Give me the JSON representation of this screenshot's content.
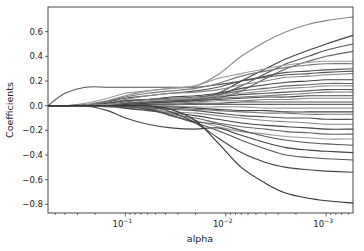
{
  "chart_data": {
    "type": "line",
    "title": "",
    "xlabel": "alpha",
    "ylabel": "Coefficients",
    "xscale": "log",
    "x_reversed": true,
    "xlim": [
      0.59,
      0.00054
    ],
    "ylim": [
      -0.87,
      0.8
    ],
    "grid": false,
    "legend": null,
    "x_ticks": [
      {
        "value": 0.1,
        "label": "10",
        "exp": "−1"
      },
      {
        "value": 0.01,
        "label": "10",
        "exp": "−2"
      },
      {
        "value": 0.001,
        "label": "10",
        "exp": "−3"
      }
    ],
    "y_ticks": [
      0.6,
      0.4,
      0.2,
      0.0,
      -0.2,
      -0.4,
      -0.6,
      -0.8
    ],
    "y_tick_labels": [
      "0.6",
      "0.4",
      "0.2",
      "0.0",
      "−0.2",
      "−0.4",
      "−0.6",
      "−0.8"
    ],
    "x": [
      0.59,
      0.4,
      0.25,
      0.15,
      0.1,
      0.06,
      0.035,
      0.02,
      0.012,
      0.007,
      0.004,
      0.0025,
      0.0015,
      0.001,
      0.00054
    ],
    "series": [
      {
        "name": "coef_1",
        "color": "#555555",
        "values": [
          0,
          0.1,
          0.15,
          0.15,
          0.15,
          0.15,
          0.15,
          0.15,
          0.17,
          0.2,
          0.23,
          0.25,
          0.26,
          0.27,
          0.28
        ]
      },
      {
        "name": "coef_2",
        "color": "#888888",
        "values": [
          0,
          0,
          0,
          0.04,
          0.08,
          0.12,
          0.14,
          0.16,
          0.25,
          0.4,
          0.52,
          0.6,
          0.66,
          0.69,
          0.72
        ]
      },
      {
        "name": "coef_3",
        "color": "#444444",
        "values": [
          0,
          0,
          0,
          0.02,
          0.04,
          0.05,
          0.05,
          0.06,
          0.1,
          0.2,
          0.3,
          0.38,
          0.45,
          0.5,
          0.57
        ]
      },
      {
        "name": "coef_4",
        "color": "#555555",
        "values": [
          0,
          0,
          0,
          0,
          0.02,
          0.03,
          0.04,
          0.05,
          0.08,
          0.16,
          0.26,
          0.34,
          0.4,
          0.45,
          0.5
        ]
      },
      {
        "name": "coef_5",
        "color": "#666666",
        "values": [
          0,
          0,
          0,
          0,
          0,
          0.02,
          0.03,
          0.04,
          0.06,
          0.12,
          0.22,
          0.3,
          0.36,
          0.4,
          0.44
        ]
      },
      {
        "name": "coef_6",
        "color": "#999999",
        "values": [
          0,
          0,
          0.02,
          0.06,
          0.1,
          0.12,
          0.14,
          0.16,
          0.22,
          0.26,
          0.3,
          0.33,
          0.35,
          0.36,
          0.36
        ]
      },
      {
        "name": "coef_7",
        "color": "#777777",
        "values": [
          0,
          0,
          0.01,
          0.04,
          0.07,
          0.1,
          0.12,
          0.14,
          0.18,
          0.24,
          0.28,
          0.31,
          0.33,
          0.34,
          0.34
        ]
      },
      {
        "name": "coef_8",
        "color": "#555555",
        "values": [
          0,
          0,
          0,
          0.03,
          0.06,
          0.08,
          0.1,
          0.12,
          0.15,
          0.2,
          0.24,
          0.27,
          0.28,
          0.29,
          0.3
        ]
      },
      {
        "name": "coef_9",
        "color": "#888888",
        "values": [
          0,
          0,
          0,
          0.02,
          0.05,
          0.08,
          0.1,
          0.11,
          0.13,
          0.17,
          0.2,
          0.23,
          0.24,
          0.25,
          0.26
        ]
      },
      {
        "name": "coef_10",
        "color": "#444444",
        "values": [
          0,
          0,
          0,
          0.02,
          0.04,
          0.05,
          0.07,
          0.08,
          0.1,
          0.14,
          0.17,
          0.19,
          0.2,
          0.21,
          0.21
        ]
      },
      {
        "name": "coef_11",
        "color": "#666666",
        "values": [
          0,
          0,
          0,
          0.01,
          0.03,
          0.05,
          0.06,
          0.07,
          0.09,
          0.12,
          0.14,
          0.16,
          0.17,
          0.18,
          0.18
        ]
      },
      {
        "name": "coef_12",
        "color": "#999999",
        "values": [
          0,
          0,
          0,
          0.01,
          0.02,
          0.04,
          0.05,
          0.06,
          0.08,
          0.1,
          0.12,
          0.14,
          0.15,
          0.16,
          0.16
        ]
      },
      {
        "name": "coef_13",
        "color": "#555555",
        "values": [
          0,
          0,
          0,
          0,
          0.02,
          0.03,
          0.04,
          0.05,
          0.07,
          0.09,
          0.1,
          0.11,
          0.12,
          0.13,
          0.13
        ]
      },
      {
        "name": "coef_14",
        "color": "#777777",
        "values": [
          0,
          0,
          0,
          0,
          0.01,
          0.02,
          0.03,
          0.04,
          0.06,
          0.07,
          0.08,
          0.09,
          0.1,
          0.11,
          0.11
        ]
      },
      {
        "name": "coef_15",
        "color": "#444444",
        "values": [
          0,
          0,
          0,
          0,
          0.01,
          0.02,
          0.03,
          0.04,
          0.05,
          0.06,
          0.07,
          0.07,
          0.08,
          0.08,
          0.08
        ]
      },
      {
        "name": "coef_16",
        "color": "#888888",
        "values": [
          0,
          0,
          0,
          0,
          0,
          0.01,
          0.02,
          0.03,
          0.04,
          0.04,
          0.05,
          0.05,
          0.06,
          0.06,
          0.06
        ]
      },
      {
        "name": "coef_17",
        "color": "#555555",
        "values": [
          0,
          0,
          0,
          0,
          0,
          0.01,
          0.01,
          0.02,
          0.02,
          0.03,
          0.03,
          0.03,
          0.03,
          0.03,
          0.03
        ]
      },
      {
        "name": "coef_18",
        "color": "#666666",
        "values": [
          0,
          0,
          0,
          0,
          0,
          0,
          0.01,
          0.01,
          0.01,
          0.01,
          0.01,
          0.01,
          0.01,
          0.01,
          0.01
        ]
      },
      {
        "name": "coef_19",
        "color": "#999999",
        "values": [
          0,
          0,
          0,
          0,
          0,
          0,
          0,
          -0.01,
          -0.01,
          -0.01,
          -0.02,
          -0.02,
          -0.02,
          -0.02,
          -0.02
        ]
      },
      {
        "name": "coef_20",
        "color": "#444444",
        "values": [
          0,
          0,
          0,
          0,
          0,
          -0.01,
          -0.01,
          -0.02,
          -0.03,
          -0.04,
          -0.04,
          -0.05,
          -0.05,
          -0.05,
          -0.05
        ]
      },
      {
        "name": "coef_21",
        "color": "#777777",
        "values": [
          0,
          0,
          0,
          0,
          -0.01,
          -0.01,
          -0.02,
          -0.03,
          -0.04,
          -0.05,
          -0.06,
          -0.06,
          -0.07,
          -0.07,
          -0.07
        ]
      },
      {
        "name": "coef_22",
        "color": "#555555",
        "values": [
          0,
          0,
          0,
          0,
          -0.01,
          -0.02,
          -0.03,
          -0.04,
          -0.06,
          -0.08,
          -0.09,
          -0.1,
          -0.1,
          -0.11,
          -0.11
        ]
      },
      {
        "name": "coef_23",
        "color": "#888888",
        "values": [
          0,
          0,
          0,
          -0.01,
          -0.02,
          -0.03,
          -0.05,
          -0.06,
          -0.08,
          -0.1,
          -0.12,
          -0.13,
          -0.14,
          -0.15,
          -0.15
        ]
      },
      {
        "name": "coef_24",
        "color": "#444444",
        "values": [
          0,
          0,
          0,
          0,
          -0.02,
          -0.04,
          -0.06,
          -0.08,
          -0.11,
          -0.14,
          -0.16,
          -0.17,
          -0.18,
          -0.19,
          -0.19
        ]
      },
      {
        "name": "coef_25",
        "color": "#666666",
        "values": [
          0,
          0,
          0,
          0,
          0,
          -0.03,
          -0.07,
          -0.1,
          -0.14,
          -0.17,
          -0.19,
          -0.21,
          -0.22,
          -0.23,
          -0.23
        ]
      },
      {
        "name": "coef_26",
        "color": "#999999",
        "values": [
          0,
          0,
          0,
          0,
          0,
          -0.02,
          -0.06,
          -0.12,
          -0.17,
          -0.21,
          -0.23,
          -0.25,
          -0.26,
          -0.27,
          -0.27
        ]
      },
      {
        "name": "coef_27",
        "color": "#555555",
        "values": [
          0,
          0,
          0,
          0,
          0,
          -0.02,
          -0.08,
          -0.13,
          -0.15,
          -0.2,
          -0.25,
          -0.28,
          -0.3,
          -0.31,
          -0.32
        ]
      },
      {
        "name": "coef_28",
        "color": "#444444",
        "values": [
          0,
          0,
          0,
          -0.04,
          -0.1,
          -0.15,
          -0.18,
          -0.19,
          -0.18,
          -0.24,
          -0.3,
          -0.34,
          -0.36,
          -0.37,
          -0.38
        ]
      },
      {
        "name": "coef_29",
        "color": "#555555",
        "values": [
          0,
          0,
          0,
          0,
          0,
          -0.03,
          -0.08,
          -0.14,
          -0.2,
          -0.28,
          -0.35,
          -0.4,
          -0.42,
          -0.43,
          -0.44
        ]
      },
      {
        "name": "coef_30",
        "color": "#444444",
        "values": [
          0,
          0,
          0,
          0,
          0,
          0,
          -0.05,
          -0.14,
          -0.26,
          -0.38,
          -0.46,
          -0.5,
          -0.52,
          -0.53,
          -0.54
        ]
      },
      {
        "name": "coef_31",
        "color": "#333333",
        "values": [
          0,
          0,
          0,
          0,
          0,
          0,
          -0.03,
          -0.12,
          -0.3,
          -0.5,
          -0.63,
          -0.71,
          -0.75,
          -0.77,
          -0.79
        ]
      }
    ]
  }
}
